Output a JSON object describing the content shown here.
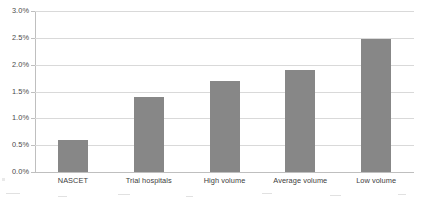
{
  "chart_data": {
    "type": "bar",
    "title": "",
    "xlabel": "",
    "ylabel": "",
    "categories": [
      "NASCET",
      "Trial hospitals",
      "High volume",
      "Average volume",
      "Low volume"
    ],
    "values": [
      0.6,
      1.4,
      1.7,
      1.9,
      2.48
    ],
    "value_labels": [
      "0.6%",
      "1.4%",
      "1.7%",
      "1.9%",
      "2.5%"
    ],
    "ylim": [
      0.0,
      3.0
    ],
    "y_tick_values": [
      0.0,
      0.5,
      1.0,
      1.5,
      2.0,
      2.5,
      3.0
    ],
    "y_tick_labels": [
      "0.0%",
      "0.5%",
      "1.0%",
      "1.5%",
      "2.0%",
      "2.5%",
      "3.0%"
    ],
    "grid": true,
    "legend": false,
    "series": [
      {
        "name": "",
        "values": [
          0.6,
          1.4,
          1.7,
          1.9,
          2.48
        ]
      }
    ],
    "colors": {
      "bar": "#878787",
      "gridline": "#d9d9d9",
      "axis": "#bfbfbf",
      "tick_text": "#4a4a4a",
      "category_text": "#3d3d3d",
      "background": "#ffffff"
    }
  }
}
